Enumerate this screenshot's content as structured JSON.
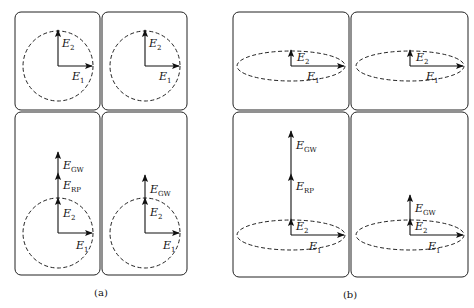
{
  "figure": {
    "panels": [
      {
        "id": "a",
        "caption": "(a)",
        "shape": "circle",
        "cells": [
          {
            "position": "top-left",
            "vectors": [
              "E1",
              "E2"
            ]
          },
          {
            "position": "top-right",
            "vectors": [
              "E1",
              "E2"
            ]
          },
          {
            "position": "bottom-left",
            "vectors": [
              "E1",
              "E2",
              "E_RP",
              "E_GW"
            ]
          },
          {
            "position": "bottom-right",
            "vectors": [
              "E1",
              "E2",
              "E_GW"
            ]
          }
        ]
      },
      {
        "id": "b",
        "caption": "(b)",
        "shape": "ellipse",
        "cells": [
          {
            "position": "top-left",
            "vectors": [
              "E1",
              "E2"
            ]
          },
          {
            "position": "top-right",
            "vectors": [
              "E1",
              "E2"
            ]
          },
          {
            "position": "bottom-left",
            "vectors": [
              "E1",
              "E2",
              "E_RP",
              "E_GW"
            ]
          },
          {
            "position": "bottom-right",
            "vectors": [
              "E1",
              "E2",
              "E_GW"
            ]
          }
        ]
      }
    ],
    "labels": {
      "E": "E",
      "sub1": "1",
      "sub2": "2",
      "subRP": "RP",
      "subGW": "GW"
    }
  }
}
